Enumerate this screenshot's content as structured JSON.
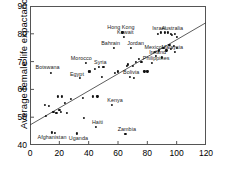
{
  "chart_data": {
    "type": "scatter",
    "title": "",
    "xlabel": "",
    "ylabel": "Average female life expactancy",
    "xlim": [
      0,
      120
    ],
    "ylim": [
      40,
      90
    ],
    "xticks": [
      0,
      20,
      40,
      60,
      80,
      100,
      120
    ],
    "yticks": [
      40,
      50,
      60,
      70,
      80,
      90
    ],
    "grid": false,
    "legend": null,
    "trendline": {
      "x": [
        0,
        120
      ],
      "y": [
        47.2,
        84.0
      ]
    },
    "points": [
      {
        "x": 10,
        "y": 54.5,
        "label": ""
      },
      {
        "x": 11,
        "y": 50.5,
        "label": ""
      },
      {
        "x": 13,
        "y": 54.0,
        "label": ""
      },
      {
        "x": 14,
        "y": 66.0,
        "label": "Botswana"
      },
      {
        "x": 15,
        "y": 44.5,
        "label": "Afghanistan"
      },
      {
        "x": 16,
        "y": 52.0,
        "label": ""
      },
      {
        "x": 17,
        "y": 44.3,
        "label": ""
      },
      {
        "x": 18,
        "y": 51.5,
        "label": ""
      },
      {
        "x": 19,
        "y": 57.5,
        "label": ""
      },
      {
        "x": 20,
        "y": 52.5,
        "label": ""
      },
      {
        "x": 21,
        "y": 52.0,
        "label": ""
      },
      {
        "x": 22,
        "y": 57.5,
        "label": ""
      },
      {
        "x": 24,
        "y": 55.0,
        "label": ""
      },
      {
        "x": 25,
        "y": 51.5,
        "label": ""
      },
      {
        "x": 28,
        "y": 56.5,
        "label": ""
      },
      {
        "x": 32,
        "y": 44.2,
        "label": "Uganda"
      },
      {
        "x": 34,
        "y": 64.0,
        "label": "Egypt"
      },
      {
        "x": 36,
        "y": 57.0,
        "label": ""
      },
      {
        "x": 37,
        "y": 49.8,
        "label": ""
      },
      {
        "x": 38,
        "y": 69.5,
        "label": "Morocco"
      },
      {
        "x": 40,
        "y": 66.5,
        "label": ""
      },
      {
        "x": 41,
        "y": 66.5,
        "label": ""
      },
      {
        "x": 43,
        "y": 57.5,
        "label": ""
      },
      {
        "x": 44,
        "y": 67.5,
        "label": ""
      },
      {
        "x": 45,
        "y": 46.5,
        "label": "Haiti"
      },
      {
        "x": 46,
        "y": 57.5,
        "label": ""
      },
      {
        "x": 47,
        "y": 68.0,
        "label": "Syria"
      },
      {
        "x": 49,
        "y": 64.5,
        "label": ""
      },
      {
        "x": 50,
        "y": 68.0,
        "label": ""
      },
      {
        "x": 56,
        "y": 54.5,
        "label": "Kenya"
      },
      {
        "x": 57,
        "y": 75.0,
        "label": "Bahrain"
      },
      {
        "x": 58,
        "y": 66.0,
        "label": ""
      },
      {
        "x": 60,
        "y": 66.5,
        "label": ""
      },
      {
        "x": 63,
        "y": 80.5,
        "label": "Hong Kong"
      },
      {
        "x": 64,
        "y": 79.0,
        "label": "Kuwait"
      },
      {
        "x": 65,
        "y": 44.0,
        "label": "Zambia"
      },
      {
        "x": 66,
        "y": 68.5,
        "label": ""
      },
      {
        "x": 67,
        "y": 69.0,
        "label": ""
      },
      {
        "x": 68,
        "y": 64.5,
        "label": "Bolivia"
      },
      {
        "x": 69,
        "y": 75.0,
        "label": "Jordan"
      },
      {
        "x": 70,
        "y": 68.5,
        "label": ""
      },
      {
        "x": 71,
        "y": 64.0,
        "label": ""
      },
      {
        "x": 72,
        "y": 70.0,
        "label": ""
      },
      {
        "x": 74,
        "y": 71.0,
        "label": ""
      },
      {
        "x": 76,
        "y": 70.0,
        "label": ""
      },
      {
        "x": 78,
        "y": 66.5,
        "label": ""
      },
      {
        "x": 80,
        "y": 66.5,
        "label": ""
      },
      {
        "x": 83,
        "y": 69.5,
        "label": "Philippines"
      },
      {
        "x": 85,
        "y": 73.5,
        "label": "Mexico"
      },
      {
        "x": 86,
        "y": 72.0,
        "label": "Ireland"
      },
      {
        "x": 87,
        "y": 80.0,
        "label": ""
      },
      {
        "x": 88,
        "y": 74.0,
        "label": ""
      },
      {
        "x": 89,
        "y": 80.5,
        "label": "Israel"
      },
      {
        "x": 90,
        "y": 71.5,
        "label": ""
      },
      {
        "x": 91,
        "y": 75.0,
        "label": ""
      },
      {
        "x": 92,
        "y": 80.5,
        "label": ""
      },
      {
        "x": 93,
        "y": 74.0,
        "label": "Malaysia"
      },
      {
        "x": 94,
        "y": 80.5,
        "label": "Australia"
      },
      {
        "x": 95,
        "y": 76.0,
        "label": ""
      },
      {
        "x": 96,
        "y": 80.0,
        "label": ""
      },
      {
        "x": 96,
        "y": 74.5,
        "label": ""
      },
      {
        "x": 97,
        "y": 79.5,
        "label": ""
      },
      {
        "x": 98,
        "y": 75.5,
        "label": ""
      },
      {
        "x": 99,
        "y": 80.0,
        "label": ""
      },
      {
        "x": 99,
        "y": 73.5,
        "label": ""
      },
      {
        "x": 100,
        "y": 79.0,
        "label": ""
      },
      {
        "x": 100,
        "y": 75.0,
        "label": ""
      }
    ],
    "annotations": [
      {
        "text": "Botswana",
        "x": 12,
        "y": 68.2
      },
      {
        "text": "Afghanistan",
        "x": 15,
        "y": 42.8
      },
      {
        "text": "Uganda",
        "x": 33,
        "y": 42.6
      },
      {
        "text": "Egypt",
        "x": 32,
        "y": 65.7
      },
      {
        "text": "Morocco",
        "x": 35,
        "y": 71.3
      },
      {
        "text": "Haiti",
        "x": 46,
        "y": 48.2
      },
      {
        "text": "Syria",
        "x": 48,
        "y": 69.8
      },
      {
        "text": "Kenya",
        "x": 58,
        "y": 56.3
      },
      {
        "text": "Bahrain",
        "x": 55,
        "y": 76.7
      },
      {
        "text": "Hong Kong",
        "x": 62,
        "y": 82.3
      },
      {
        "text": "Kuwait",
        "x": 65,
        "y": 80.6
      },
      {
        "text": "Zambia",
        "x": 66,
        "y": 45.8
      },
      {
        "text": "Bolivia",
        "x": 69,
        "y": 66.2
      },
      {
        "text": "Jordan",
        "x": 72,
        "y": 76.7
      },
      {
        "text": "Philippines",
        "x": 86,
        "y": 71.3
      },
      {
        "text": "Mexico",
        "x": 84,
        "y": 75.3
      },
      {
        "text": "Ireland",
        "x": 87,
        "y": 73.3
      },
      {
        "text": "Israel",
        "x": 88,
        "y": 82.1
      },
      {
        "text": "Australia",
        "x": 97,
        "y": 82.1
      },
      {
        "text": "Malaysia",
        "x": 97,
        "y": 75.3
      }
    ]
  }
}
